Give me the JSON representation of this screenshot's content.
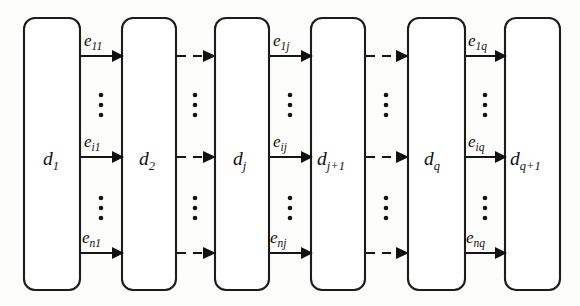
{
  "figure": {
    "type": "block-chain-diagram",
    "title": "",
    "background_color": "#fdfdfc",
    "stroke_color": "#151515",
    "node_fill": "#ffffff",
    "width": 580,
    "height": 306
  },
  "nodes": [
    {
      "id": "d1",
      "base": "d",
      "sub": "1",
      "x": 24,
      "y": 18,
      "w": 56,
      "h": 272
    },
    {
      "id": "d2",
      "base": "d",
      "sub": "2",
      "x": 122,
      "y": 18,
      "w": 54,
      "h": 272
    },
    {
      "id": "dj",
      "base": "d",
      "sub": "j",
      "x": 215,
      "y": 18,
      "w": 54,
      "h": 272
    },
    {
      "id": "dj1",
      "base": "d",
      "sub": "j+1",
      "x": 311,
      "y": 18,
      "w": 54,
      "h": 272
    },
    {
      "id": "dq",
      "base": "d",
      "sub": "q",
      "x": 408,
      "y": 18,
      "w": 57,
      "h": 272
    },
    {
      "id": "dq1",
      "base": "d",
      "sub": "q+1",
      "x": 505,
      "y": 18,
      "w": 55,
      "h": 272
    }
  ],
  "edge_rows": [
    {
      "row": "top",
      "y": 56
    },
    {
      "row": "middle",
      "y": 157
    },
    {
      "row": "bottom",
      "y": 253
    }
  ],
  "ellipsis_rows": [
    {
      "row": "upper",
      "y": 105
    },
    {
      "row": "lower",
      "y": 208
    }
  ],
  "gaps": [
    {
      "gap": "d1-d2",
      "from": "d1",
      "to": "d2",
      "style": "solid",
      "labeled": true,
      "labels": {
        "top": {
          "base": "e",
          "sub": "11"
        },
        "middle": {
          "base": "e",
          "sub": "i1"
        },
        "bottom": {
          "base": "e",
          "sub": "n1"
        }
      }
    },
    {
      "gap": "d2-dj",
      "from": "d2",
      "to": "dj",
      "style": "dashed",
      "labeled": false,
      "labels": {
        "top": null,
        "middle": null,
        "bottom": null
      }
    },
    {
      "gap": "dj-dj1",
      "from": "dj",
      "to": "dj1",
      "style": "solid",
      "labeled": true,
      "labels": {
        "top": {
          "base": "e",
          "sub": "1j"
        },
        "middle": {
          "base": "e",
          "sub": "ij"
        },
        "bottom": {
          "base": "e",
          "sub": "nj"
        }
      }
    },
    {
      "gap": "dj1-dq",
      "from": "dj1",
      "to": "dq",
      "style": "dashed",
      "labeled": false,
      "labels": {
        "top": null,
        "middle": null,
        "bottom": null
      }
    },
    {
      "gap": "dq-dq1",
      "from": "dq",
      "to": "dq1",
      "style": "solid",
      "labeled": true,
      "labels": {
        "top": {
          "base": "e",
          "sub": "1q"
        },
        "middle": {
          "base": "e",
          "sub": "iq"
        },
        "bottom": {
          "base": "e",
          "sub": "nq"
        }
      }
    }
  ],
  "ellipsis_columns": [
    {
      "gap": "d1-d2",
      "x": 101
    },
    {
      "gap": "d2-dj",
      "x": 195
    },
    {
      "gap": "dj-dj1",
      "x": 290
    },
    {
      "gap": "dj1-dq",
      "x": 386
    },
    {
      "gap": "dq-dq1",
      "x": 485
    }
  ],
  "node_labels_text": {
    "d1": "d1",
    "d2": "d2",
    "dj": "dj",
    "dj1": "dj+1",
    "dq": "dq",
    "dq1": "dq+1"
  },
  "edge_labels_text": {
    "e11": "e11",
    "ei1": "ei1",
    "en1": "en1",
    "e1j": "e1j",
    "eij": "eij",
    "enj": "enj",
    "e1q": "e1q",
    "eiq": "eiq",
    "enq": "enq"
  }
}
